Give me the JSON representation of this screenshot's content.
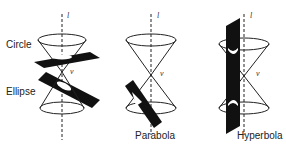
{
  "figure": {
    "panels": [
      {
        "id": "circle-ellipse",
        "labels": [
          "Circle",
          "Ellipse"
        ],
        "axis_label": "l",
        "vertex_label": "v"
      },
      {
        "id": "parabola",
        "labels": [
          "Parabola"
        ],
        "axis_label": "l",
        "vertex_label": "v"
      },
      {
        "id": "hyperbola",
        "labels": [
          "Hyperbola"
        ],
        "axis_label": "l",
        "vertex_label": "v"
      }
    ]
  },
  "colors": {
    "line": "#222222",
    "plane": "#111111",
    "background": "#ffffff"
  }
}
